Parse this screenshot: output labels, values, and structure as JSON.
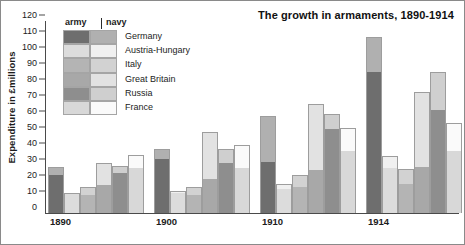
{
  "chart": {
    "title": "The growth in armaments, 1890-1914",
    "ylabel": "Expenditure in £millions",
    "legend": {
      "army_header": "army",
      "navy_header": "navy"
    }
  },
  "chart_data": {
    "type": "bar",
    "title": "The growth in armaments, 1890-1914",
    "xlabel": "",
    "ylabel": "Expenditure in £millions",
    "ylim": [
      0,
      120
    ],
    "yticks": [
      0,
      10,
      20,
      30,
      40,
      50,
      60,
      70,
      80,
      90,
      100,
      110,
      120
    ],
    "grid": false,
    "legend_position": "top-left",
    "stacked": true,
    "stack_order": [
      "army",
      "navy"
    ],
    "note": "Each bar is a stacked total of army (lower, darker) and navy (upper, lighter) spending; totals are the bar tops.",
    "categories": [
      "1890",
      "1900",
      "1910",
      "1914"
    ],
    "countries": [
      "Germany",
      "Austria-Hungary",
      "Italy",
      "Great Britain",
      "Russia",
      "France"
    ],
    "colors": {
      "Germany": {
        "army": "#6e6e6e",
        "navy": "#b0b0b0"
      },
      "Austria-Hungary": {
        "army": "#dcdcdc",
        "navy": "#f0f0f0"
      },
      "Italy": {
        "army": "#b4b4b4",
        "navy": "#d2d2d2"
      },
      "Great Britain": {
        "army": "#a8a8a8",
        "navy": "#e2e2e2"
      },
      "Russia": {
        "army": "#8e8e8e",
        "navy": "#cfcfcf"
      },
      "France": {
        "army": "#d8d8d8",
        "navy": "#fafafa"
      }
    },
    "series": [
      {
        "name": "Germany",
        "army": [
          24,
          34,
          32,
          88
        ],
        "navy": [
          5,
          6,
          28.5,
          22
        ],
        "total": [
          29,
          40,
          60.5,
          110
        ]
      },
      {
        "name": "Austria-Hungary",
        "army": [
          12,
          12.5,
          15,
          28
        ],
        "navy": [
          0.5,
          1.5,
          3,
          7.5
        ],
        "total": [
          12.5,
          14,
          18,
          35.5
        ]
      },
      {
        "name": "Italy",
        "army": [
          11,
          11,
          16,
          18
        ],
        "navy": [
          5,
          5,
          8,
          9.5
        ],
        "total": [
          16,
          16,
          24,
          27.5
        ]
      },
      {
        "name": "Great Britain",
        "army": [
          17.5,
          21,
          27,
          29
        ],
        "navy": [
          14,
          29.5,
          41,
          46.5
        ],
        "total": [
          31.5,
          50.5,
          68,
          75.5
        ]
      },
      {
        "name": "Russia",
        "army": [
          25,
          31.5,
          52.5,
          64.5
        ],
        "navy": [
          4.5,
          8.5,
          9.5,
          23.5
        ],
        "total": [
          29.5,
          40,
          62,
          88
        ]
      },
      {
        "name": "France",
        "army": [
          28,
          28,
          38.5,
          39
        ],
        "navy": [
          8.5,
          14.5,
          14.5,
          17.5
        ],
        "total": [
          36.5,
          42.5,
          53,
          56.5
        ]
      }
    ]
  }
}
